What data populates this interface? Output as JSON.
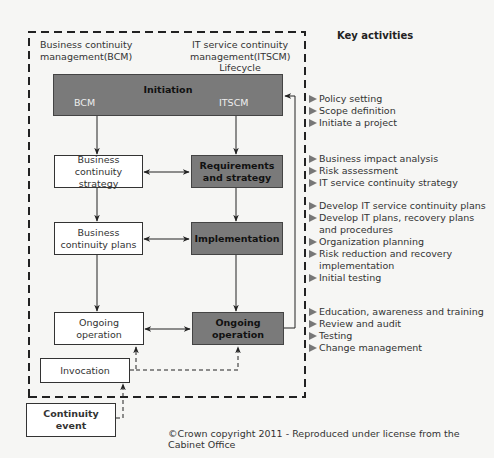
{
  "header": {
    "bcm_label": "Business continuity management(BCM)",
    "itscm_label": "IT service continuity management(ITSCM)",
    "lifecycle_label": "Lifecycle",
    "key_activities_title": "Key activities"
  },
  "boxes": {
    "initiation": {
      "title": "Initiation",
      "left_sub": "BCM",
      "right_sub": "ITSCM"
    },
    "bc_strategy": "Business continuity strategy",
    "requirements_strategy": "Requirements and strategy",
    "bc_plans": "Business continuity plans",
    "implementation": "Implementation",
    "ongoing_operation_bcm": "Ongoing operation",
    "ongoing_operation_itscm": "Ongoing operation",
    "invocation": "Invocation",
    "continuity_event": "Continuity event"
  },
  "key_activities": [
    {
      "stage": "Initiation",
      "items": [
        "Policy setting",
        "Scope definition",
        "Initiate a project"
      ]
    },
    {
      "stage": "Requirements and strategy",
      "items": [
        "Business impact analysis",
        "Risk assessment",
        "IT service continuity strategy"
      ]
    },
    {
      "stage": "Implementation",
      "items": [
        "Develop IT service continuity plans",
        "Develop IT plans, recovery plans and procedures",
        "Organization planning",
        "Risk reduction and recovery implementation",
        "Initial testing"
      ]
    },
    {
      "stage": "Ongoing operation",
      "items": [
        "Education, awareness and training",
        "Review and audit",
        "Testing",
        "Change management"
      ]
    }
  ],
  "colors": {
    "stage_fill": "#7a7a7a",
    "bcm_fill": "#ffffff",
    "line": "#222222"
  },
  "footer": {
    "copyright": "©Crown copyright 2011 - Reproduced under license from the Cabinet Office"
  }
}
